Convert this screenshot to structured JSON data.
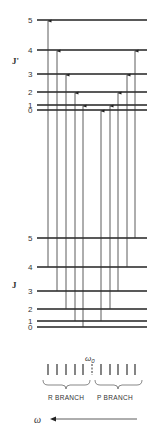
{
  "diagram": {
    "upper_label": "J'",
    "lower_label": "J",
    "upper_levels": [
      {
        "j": "5",
        "y": 20
      },
      {
        "j": "4",
        "y": 50
      },
      {
        "j": "3",
        "y": 74
      },
      {
        "j": "2",
        "y": 92
      },
      {
        "j": "1",
        "y": 105
      },
      {
        "j": "0",
        "y": 110
      }
    ],
    "lower_levels": [
      {
        "j": "5",
        "y": 238
      },
      {
        "j": "4",
        "y": 267
      },
      {
        "j": "3",
        "y": 291
      },
      {
        "j": "2",
        "y": 309
      },
      {
        "j": "1",
        "y": 321
      },
      {
        "j": "0",
        "y": 327
      }
    ],
    "transitions": [
      {
        "branch": "R",
        "x": 48,
        "from": "4",
        "to": "5"
      },
      {
        "branch": "R",
        "x": 57,
        "from": "3",
        "to": "4"
      },
      {
        "branch": "R",
        "x": 66,
        "from": "2",
        "to": "3"
      },
      {
        "branch": "R",
        "x": 75,
        "from": "1",
        "to": "2"
      },
      {
        "branch": "R",
        "x": 83,
        "from": "0",
        "to": "1"
      },
      {
        "branch": "P",
        "x": 101,
        "from": "1",
        "to": "0"
      },
      {
        "branch": "P",
        "x": 110,
        "from": "2",
        "to": "1"
      },
      {
        "branch": "P",
        "x": 118,
        "from": "3",
        "to": "2"
      },
      {
        "branch": "P",
        "x": 127,
        "from": "4",
        "to": "3"
      },
      {
        "branch": "P",
        "x": 135,
        "from": "5",
        "to": "4"
      }
    ],
    "spectrum": {
      "center_label": "ω",
      "center_subscript": "0",
      "r_branch_label": "R BRANCH",
      "p_branch_label": "P BRANCH",
      "frequency_label": "ω"
    }
  }
}
